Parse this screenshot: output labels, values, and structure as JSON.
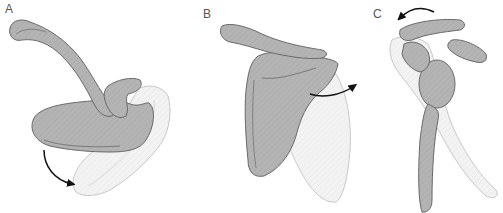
{
  "figure": {
    "panels": [
      {
        "id": "A",
        "label": "A",
        "motion": "downward-rotation-arrow"
      },
      {
        "id": "B",
        "label": "B",
        "motion": "lateral-rotation-arrow"
      },
      {
        "id": "C",
        "label": "C",
        "motion": "posterior-tilt-arrow"
      }
    ],
    "colors": {
      "bone_fill": "#b4b4b4",
      "bone_stroke": "#6a6a6a",
      "ghost_fill": "#f2f2f2",
      "ghost_stroke": "#c8c8c8",
      "arrow": "#111111",
      "label": "#555555"
    }
  }
}
